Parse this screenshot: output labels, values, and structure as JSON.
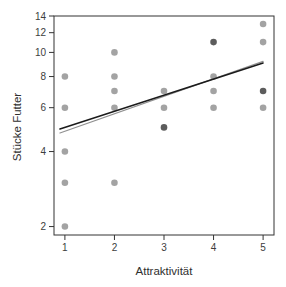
{
  "chart_data": {
    "type": "scatter",
    "title": "",
    "xlabel": "Attraktivität",
    "ylabel": "Stücke Futter",
    "x_ticks": [
      1,
      2,
      3,
      4,
      5
    ],
    "y_ticks": [
      2,
      4,
      6,
      8,
      10,
      12,
      14
    ],
    "y_scale": "log10",
    "xlim": [
      0.78,
      5.22
    ],
    "ylim": [
      1.85,
      14.0
    ],
    "grid": false,
    "legend": "none",
    "points": [
      {
        "x": 1,
        "y": 8,
        "overlap": false
      },
      {
        "x": 1,
        "y": 6,
        "overlap": false
      },
      {
        "x": 1,
        "y": 4,
        "overlap": false
      },
      {
        "x": 1,
        "y": 3,
        "overlap": false
      },
      {
        "x": 1,
        "y": 2,
        "overlap": false
      },
      {
        "x": 2,
        "y": 10,
        "overlap": false
      },
      {
        "x": 2,
        "y": 8,
        "overlap": false
      },
      {
        "x": 2,
        "y": 7,
        "overlap": false
      },
      {
        "x": 2,
        "y": 6,
        "overlap": false
      },
      {
        "x": 2,
        "y": 3,
        "overlap": false
      },
      {
        "x": 3,
        "y": 7,
        "overlap": false
      },
      {
        "x": 3,
        "y": 6,
        "overlap": false
      },
      {
        "x": 3,
        "y": 5,
        "overlap": true
      },
      {
        "x": 4,
        "y": 11,
        "overlap": true
      },
      {
        "x": 4,
        "y": 8,
        "overlap": false
      },
      {
        "x": 4,
        "y": 7,
        "overlap": false
      },
      {
        "x": 4,
        "y": 6,
        "overlap": false
      },
      {
        "x": 5,
        "y": 13,
        "overlap": false
      },
      {
        "x": 5,
        "y": 11,
        "overlap": false
      },
      {
        "x": 5,
        "y": 7,
        "overlap": true
      },
      {
        "x": 5,
        "y": 6,
        "overlap": false
      }
    ],
    "lines": [
      {
        "name": "fit-line-gray",
        "color": "#909090",
        "width": 1.2,
        "x1": 0.9,
        "y1": 4.75,
        "x2": 5,
        "y2": 9.2
      },
      {
        "name": "fit-line-black",
        "color": "#1b1b1b",
        "width": 1.5,
        "x1": 0.9,
        "y1": 4.93,
        "x2": 5,
        "y2": 9.07
      }
    ],
    "colors": {
      "point": "#9b9b9b",
      "point_overlap": "#4e4e4e",
      "axis": "#333333",
      "tick_label": "#3d3d3d"
    }
  }
}
